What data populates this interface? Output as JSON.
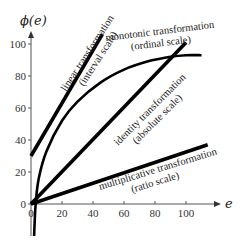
{
  "chart_data": {
    "type": "line",
    "title": "",
    "xlabel": "e",
    "ylabel": "ϕ(e)",
    "xlim": [
      0,
      120
    ],
    "ylim": [
      -22,
      105
    ],
    "grid": false,
    "x_ticks": [
      0,
      20,
      40,
      60,
      80,
      100
    ],
    "y_ticks": [
      0,
      20,
      40,
      60,
      80,
      100
    ],
    "x_tick_labels": [
      "0",
      "20",
      "40",
      "60",
      "80",
      "100"
    ],
    "y_tick_labels": [
      "0",
      "20",
      "40",
      "60",
      "80",
      "100"
    ],
    "line_color": "#000000",
    "axis_color": "#555555",
    "series": [
      {
        "name": "linear transformation (interval scale)",
        "kind": "line",
        "x": [
          0,
          46
        ],
        "y": [
          30,
          106
        ]
      },
      {
        "name": "monotonic transformation (ordinal scale)",
        "kind": "curve",
        "x": [
          2,
          3,
          5,
          10,
          20,
          30,
          45,
          60,
          75,
          90,
          100,
          110
        ],
        "y": [
          -20,
          0,
          16,
          33,
          52,
          64,
          76,
          84,
          89,
          92,
          93,
          93
        ]
      },
      {
        "name": "identity transformation (absolute scale)",
        "kind": "line",
        "x": [
          0,
          100
        ],
        "y": [
          0,
          101
        ]
      },
      {
        "name": "multiplicative transformation (ratio scale)",
        "kind": "line",
        "x": [
          0,
          114
        ],
        "y": [
          0,
          37
        ]
      }
    ],
    "annotations": [
      {
        "id": "linear",
        "lines": [
          "linear transformation",
          "(interval scale)"
        ]
      },
      {
        "id": "monotonic",
        "lines": [
          "monotonic transformation",
          "(ordinal scale)"
        ]
      },
      {
        "id": "identity",
        "lines": [
          "identity transformation",
          "(absolute scale)"
        ]
      },
      {
        "id": "multiplicative",
        "lines": [
          "multiplicative transformation",
          "(ratio scale)"
        ]
      }
    ]
  }
}
